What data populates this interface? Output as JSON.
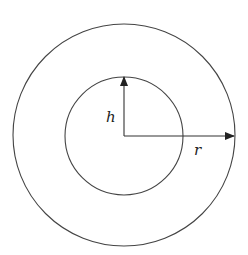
{
  "diagram": {
    "type": "concentric-circles",
    "labels": {
      "height": "h",
      "radius": "r"
    },
    "colors": {
      "stroke": "#333333",
      "background": "#ffffff"
    }
  }
}
